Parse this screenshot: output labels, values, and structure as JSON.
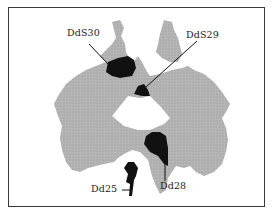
{
  "figure": {
    "type": "inkblot-location-diagram",
    "colors": {
      "frame": "#3a3a3a",
      "blot": "#b4b4b4",
      "highlight": "#111111",
      "background": "#ffffff"
    },
    "labels": [
      {
        "id": "DdS30",
        "text": "DdS30"
      },
      {
        "id": "DdS29",
        "text": "DdS29"
      },
      {
        "id": "Dd25",
        "text": "Dd25"
      },
      {
        "id": "Dd28",
        "text": "Dd28"
      }
    ]
  }
}
